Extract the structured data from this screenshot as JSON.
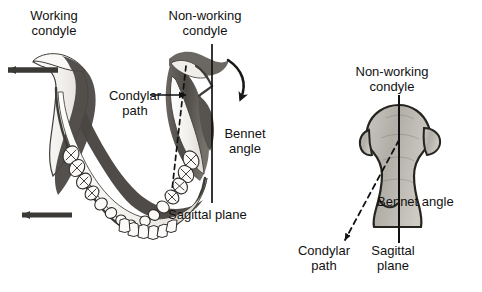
{
  "figure": {
    "background_color": "#ffffff",
    "ink_color": "#111111",
    "bone_fill_light": "#f2f1ee",
    "bone_fill_mid": "#b9b6b1",
    "bone_fill_dark": "#5e5b57",
    "condyle_fill": "#b4b1ac"
  },
  "left_panel": {
    "name": "mandible-superior-view",
    "labels": {
      "working_condyle": "Working\ncondyle",
      "non_working_condyle": "Non-working\ncondyle",
      "condylar_path": "Condylar\npath",
      "bennet_angle": "Bennet\nangle",
      "sagittal_plane": "Sagittal plane"
    },
    "annotations": {
      "working_side_arrow": "arrow pointing left at working condyle",
      "body_arrow": "arrow pointing left at mandibular body",
      "rotation_arrow": "curved arrow pointing down-left at non-working condyle",
      "leader_line": "horizontal leader from Condylar path label to dashed path"
    }
  },
  "right_panel": {
    "name": "condyle-detail-view",
    "labels": {
      "non_working_condyle": "Non-working\ncondyle",
      "bennet_angle": "Bennet angle",
      "condylar_path": "Condylar\npath",
      "sagittal_plane": "Sagittal\nplane"
    },
    "annotations": {
      "sagittal_line": "solid vertical line through condyle",
      "condylar_path_line": "dashed line angled down-left from condyle apex"
    }
  }
}
